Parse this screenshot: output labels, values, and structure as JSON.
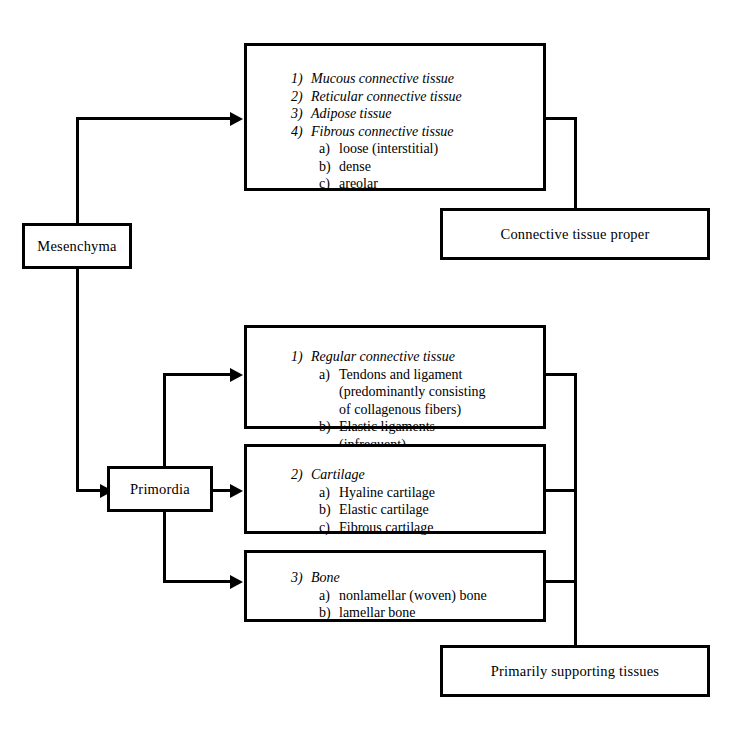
{
  "diagram": {
    "colors": {
      "line": "#000000",
      "background": "#ffffff",
      "text": "#000000"
    }
  },
  "nodes": {
    "mesenchyma": {
      "label": "Mesenchyma"
    },
    "primordia": {
      "label": "Primordia"
    },
    "connective_tissue_proper": {
      "label": "Connective tissue proper"
    },
    "primarily_supporting_tissues": {
      "label": "Primarily supporting tissues"
    },
    "box_connective_proper_list": {
      "items": [
        {
          "num": "1)",
          "text": "Mucous connective tissue",
          "level": 1
        },
        {
          "num": "2)",
          "text": "Reticular connective tissue",
          "level": 1
        },
        {
          "num": "3)",
          "text": "Adipose tissue",
          "level": 1
        },
        {
          "num": "4)",
          "text": "Fibrous connective tissue",
          "level": 1
        },
        {
          "num": "a)",
          "text": "loose (interstitial)",
          "level": 2
        },
        {
          "num": "b)",
          "text": "dense",
          "level": 2
        },
        {
          "num": "c)",
          "text": "areolar",
          "level": 2
        }
      ]
    },
    "box_regular_connective_list": {
      "items": [
        {
          "num": "1)",
          "text": "Regular connective tissue",
          "level": 1
        },
        {
          "num": "a)",
          "text": "Tendons and ligament",
          "level": 2
        },
        {
          "num": "",
          "text": "(predominantly consisting",
          "level": 3
        },
        {
          "num": "",
          "text": "of collagenous fibers)",
          "level": 3
        },
        {
          "num": "b)",
          "text": "Elastic ligaments",
          "level": 2
        },
        {
          "num": "",
          "text": "(infrequent)",
          "level": 3
        }
      ]
    },
    "box_cartilage_list": {
      "items": [
        {
          "num": "2)",
          "text": "Cartilage",
          "level": 1
        },
        {
          "num": "a)",
          "text": "Hyaline cartilage",
          "level": 2
        },
        {
          "num": "b)",
          "text": "Elastic cartilage",
          "level": 2
        },
        {
          "num": "c)",
          "text": "Fibrous cartilage",
          "level": 2
        }
      ]
    },
    "box_bone_list": {
      "items": [
        {
          "num": "3)",
          "text": "Bone",
          "level": 1
        },
        {
          "num": "a)",
          "text": "nonlamellar (woven) bone",
          "level": 2
        },
        {
          "num": "b)",
          "text": "lamellar bone",
          "level": 2
        }
      ]
    }
  }
}
